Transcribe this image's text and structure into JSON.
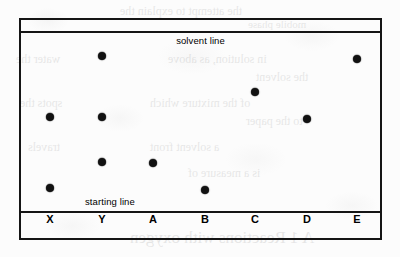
{
  "figure": {
    "type": "paper-chromatogram",
    "solvent_line_label": "solvent line",
    "starting_line_label": "starting line",
    "ink_color": "#111111",
    "plate_border_color": "#151515",
    "background_color": "#fcfcfc"
  },
  "chart_data": {
    "type": "scatter",
    "title": "",
    "subtitle": "",
    "xlabel": "",
    "ylabel": "",
    "grid": false,
    "legend": "none",
    "annotations": [
      "solvent line",
      "starting line"
    ],
    "axis_notes": {
      "solvent_line_y": 1.0,
      "starting_line_y": 0.0,
      "description": "Vertical position is distance travelled from the starting line (0.0) toward the solvent front (1.0); Rf value of each spot."
    },
    "categories": [
      "X",
      "Y",
      "A",
      "B",
      "C",
      "D",
      "E"
    ],
    "series": [
      {
        "name": "spots",
        "points": [
          {
            "lane": "X",
            "rf": 0.42
          },
          {
            "lane": "X",
            "rf": 0.03
          },
          {
            "lane": "Y",
            "rf": 0.76
          },
          {
            "lane": "Y",
            "rf": 0.42
          },
          {
            "lane": "Y",
            "rf": 0.17
          },
          {
            "lane": "A",
            "rf": 0.17
          },
          {
            "lane": "B",
            "rf": 0.02
          },
          {
            "lane": "C",
            "rf": 0.56
          },
          {
            "lane": "D",
            "rf": 0.41
          },
          {
            "lane": "E",
            "rf": 0.74
          }
        ]
      }
    ]
  },
  "lanes": [
    {
      "label": "X",
      "x": 48,
      "spots": [
        115,
        186
      ]
    },
    {
      "label": "Y",
      "x": 100,
      "spots": [
        54,
        115,
        160
      ]
    },
    {
      "label": "A",
      "x": 151,
      "spots": [
        161
      ]
    },
    {
      "label": "B",
      "x": 203,
      "spots": [
        188
      ]
    },
    {
      "label": "C",
      "x": 253,
      "spots": [
        90
      ]
    },
    {
      "label": "D",
      "x": 305,
      "spots": [
        117
      ]
    },
    {
      "label": "E",
      "x": 355,
      "spots": [
        57
      ]
    }
  ],
  "bleed_through": [
    {
      "text": "the attempt to explain the",
      "x": 120,
      "y": 4,
      "size": 12
    },
    {
      "text": "mobile phase",
      "x": 248,
      "y": 18,
      "size": 11
    },
    {
      "text": "water the",
      "x": 16,
      "y": 52,
      "size": 12
    },
    {
      "text": "in solution, as above",
      "x": 168,
      "y": 52,
      "size": 12
    },
    {
      "text": "the solvent",
      "x": 256,
      "y": 70,
      "size": 12
    },
    {
      "text": "spots the",
      "x": 20,
      "y": 96,
      "size": 12
    },
    {
      "text": "of the mixture which",
      "x": 150,
      "y": 96,
      "size": 12
    },
    {
      "text": "to the paper",
      "x": 246,
      "y": 114,
      "size": 12
    },
    {
      "text": "travels",
      "x": 28,
      "y": 140,
      "size": 12
    },
    {
      "text": "a solvent front",
      "x": 150,
      "y": 140,
      "size": 12
    },
    {
      "text": "is a measure of",
      "x": 188,
      "y": 166,
      "size": 12
    },
    {
      "text": "A 1 Reactions with oxygen",
      "x": 130,
      "y": 228,
      "size": 17
    }
  ]
}
